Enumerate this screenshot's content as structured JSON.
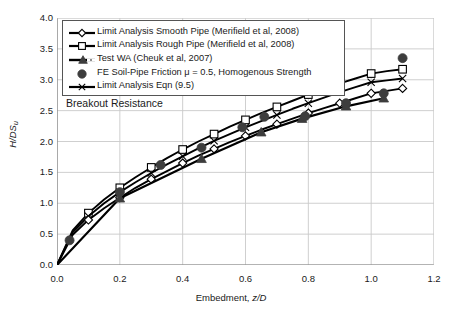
{
  "chart_data": {
    "type": "line",
    "title": "",
    "annotation": "Breakout Resistance",
    "xlabel": "Embedment, z/D",
    "ylabel": "H/DSu",
    "xlim": [
      0.0,
      1.2
    ],
    "ylim": [
      0.0,
      4.0
    ],
    "xticks": [
      "0.0",
      "0.2",
      "0.4",
      "0.6",
      "0.8",
      "1.0",
      "1.2"
    ],
    "yticks": [
      "0.0",
      "0.5",
      "1.0",
      "1.5",
      "2.0",
      "2.5",
      "3.0",
      "3.5",
      "4.0"
    ],
    "grid": true,
    "legend_position": "top-left-inside",
    "series": [
      {
        "name": "Limit Analysis Smooth Pipe (Merifield et al, 2008)",
        "marker": "open-diamond",
        "x": [
          0.0,
          0.05,
          0.1,
          0.15,
          0.2,
          0.25,
          0.3,
          0.35,
          0.4,
          0.45,
          0.5,
          0.55,
          0.6,
          0.65,
          0.7,
          0.75,
          0.8,
          0.85,
          0.9,
          0.95,
          1.0,
          1.05,
          1.1
        ],
        "y": [
          0.0,
          0.49,
          0.73,
          0.92,
          1.09,
          1.25,
          1.39,
          1.52,
          1.65,
          1.77,
          1.88,
          1.99,
          2.09,
          2.19,
          2.28,
          2.37,
          2.46,
          2.54,
          2.62,
          2.7,
          2.78,
          2.82,
          2.86
        ]
      },
      {
        "name": "Limit Analysis Rough Pipe (Merifield et al, 2008)",
        "marker": "open-square",
        "x": [
          0.0,
          0.05,
          0.1,
          0.15,
          0.2,
          0.25,
          0.3,
          0.35,
          0.4,
          0.45,
          0.5,
          0.55,
          0.6,
          0.65,
          0.7,
          0.75,
          0.8,
          0.85,
          0.9,
          0.95,
          1.0,
          1.05,
          1.1
        ],
        "y": [
          0.0,
          0.56,
          0.84,
          1.06,
          1.25,
          1.42,
          1.58,
          1.73,
          1.87,
          2.0,
          2.12,
          2.24,
          2.35,
          2.46,
          2.56,
          2.66,
          2.76,
          2.85,
          2.94,
          3.02,
          3.1,
          3.14,
          3.17
        ]
      },
      {
        "name": "Test WA (Cheuk et al, 2007)",
        "marker": "filled-triangle",
        "x": [
          0.0,
          0.2,
          0.46,
          0.65,
          0.78,
          0.92,
          1.04
        ],
        "y": [
          0.0,
          1.08,
          1.72,
          2.15,
          2.37,
          2.57,
          2.7
        ]
      },
      {
        "name": "FE Soil-Pipe Friction μ = 0.5, Homogenous Strength",
        "marker": "filled-circle",
        "line": false,
        "x": [
          0.04,
          0.2,
          0.33,
          0.46,
          0.59,
          0.66,
          0.79,
          0.92,
          1.04,
          1.1
        ],
        "y": [
          0.4,
          1.18,
          1.62,
          1.9,
          2.23,
          2.4,
          2.41,
          2.62,
          2.78,
          3.35
        ]
      },
      {
        "name": "Limit Analysis Eqn (9.5)",
        "marker": "cross-x",
        "x": [
          0.0,
          0.05,
          0.1,
          0.15,
          0.2,
          0.25,
          0.3,
          0.35,
          0.4,
          0.45,
          0.5,
          0.55,
          0.6,
          0.65,
          0.7,
          0.75,
          0.8,
          0.85,
          0.9,
          0.95,
          1.0,
          1.05,
          1.1
        ],
        "y": [
          0.0,
          0.53,
          0.79,
          1.0,
          1.18,
          1.34,
          1.49,
          1.63,
          1.76,
          1.89,
          2.01,
          2.12,
          2.23,
          2.33,
          2.43,
          2.53,
          2.62,
          2.71,
          2.8,
          2.88,
          2.96,
          2.99,
          3.02
        ]
      }
    ]
  },
  "legend": {
    "items": [
      {
        "label": "Limit Analysis Smooth Pipe (Merifield et al, 2008)",
        "marker": "open-diamond"
      },
      {
        "label": "Limit Analysis Rough Pipe (Merifield et al, 2008)",
        "marker": "open-square"
      },
      {
        "label": "Test WA (Cheuk et al, 2007)",
        "marker": "filled-triangle"
      },
      {
        "label": "FE Soil-Pipe Friction μ = 0.5, Homogenous Strength",
        "marker": "filled-circle"
      },
      {
        "label": "Limit Analysis Eqn (9.5)",
        "marker": "cross-x"
      }
    ]
  },
  "colors": {
    "line": "#000000",
    "grid": "#c9c9c9",
    "axis": "#808080",
    "text": "#1a1a1a",
    "marker_fill": "#ffffff",
    "solid_marker": "#3d3d3d"
  }
}
